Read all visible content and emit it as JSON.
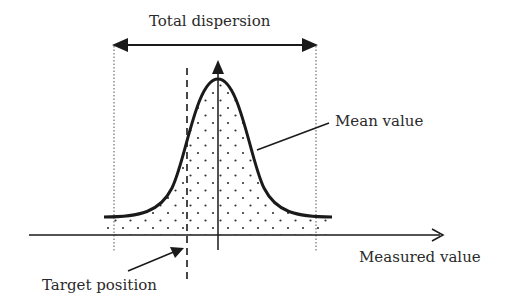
{
  "labels": {
    "total_dispersion": "Total dispersion",
    "mean_value": "Mean value",
    "measured_value": "Measured value",
    "target_position": "Target position"
  },
  "colors": {
    "line": "#1a1a1a",
    "dots": "#333333",
    "background": "#ffffff"
  },
  "diagram": {
    "type": "normal-distribution-schematic",
    "elements": [
      "bell-curve",
      "stippled-area-under-curve",
      "x-axis-arrow",
      "vertical-mean-axis-arrow",
      "target-dashed-line",
      "dispersion-bounds-dotted",
      "total-dispersion-double-arrow"
    ]
  }
}
